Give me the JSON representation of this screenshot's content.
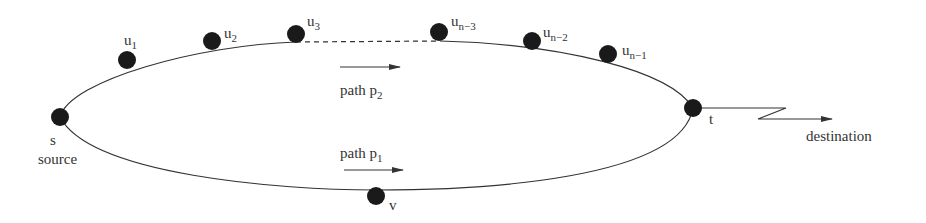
{
  "diagram": {
    "nodes": {
      "s": {
        "label": "s",
        "caption": "source"
      },
      "u1": {
        "label": "u",
        "sub": "1"
      },
      "u2": {
        "label": "u",
        "sub": "2"
      },
      "u3": {
        "label": "u",
        "sub": "3"
      },
      "un3": {
        "label": "u",
        "sub": "n−3"
      },
      "un2": {
        "label": "u",
        "sub": "n−2"
      },
      "un1": {
        "label": "u",
        "sub": "n−1"
      },
      "t": {
        "label": "t"
      },
      "v": {
        "label": "v"
      }
    },
    "paths": {
      "p2": {
        "label": "path p",
        "sub": "2"
      },
      "p1": {
        "label": "path p",
        "sub": "1"
      }
    },
    "destination": "destination",
    "colors": {
      "node": "#1a1a1a",
      "line": "#333333"
    }
  }
}
